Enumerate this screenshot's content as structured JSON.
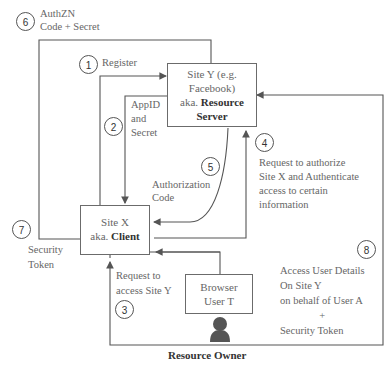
{
  "nodes": {
    "resource_server": {
      "line1": "Site Y (e.g.",
      "line2": "Facebook)",
      "line3_prefix": "aka. ",
      "line3_bold": "Resource",
      "line4_bold": "Server"
    },
    "client": {
      "line1": "Site X",
      "line2_prefix": "aka. ",
      "line2_bold": "Client"
    },
    "browser": {
      "line1": "Browser",
      "line2": "User T"
    },
    "resource_owner_label": "Resource Owner"
  },
  "steps": [
    {
      "num": "1",
      "label": [
        "Register"
      ]
    },
    {
      "num": "2",
      "label": [
        "AppID",
        "and",
        "Secret"
      ]
    },
    {
      "num": "3",
      "label": [
        "Request to",
        "access Site Y"
      ]
    },
    {
      "num": "4",
      "label": [
        "Request to authorize",
        "Site X and Authenticate",
        "access to certain",
        "information"
      ]
    },
    {
      "num": "5",
      "label": [
        "Authorization",
        "Code"
      ]
    },
    {
      "num": "6",
      "label": [
        "AuthZN",
        "Code + Secret"
      ]
    },
    {
      "num": "7",
      "label": [
        "Security",
        "Token"
      ]
    },
    {
      "num": "8",
      "label": [
        "Access User Details",
        "On Site Y",
        "on behalf of User A",
        "+",
        "Security Token"
      ]
    }
  ],
  "colors": {
    "line": "#555555",
    "box_border": "#6b6b6b",
    "person": "#555555"
  }
}
